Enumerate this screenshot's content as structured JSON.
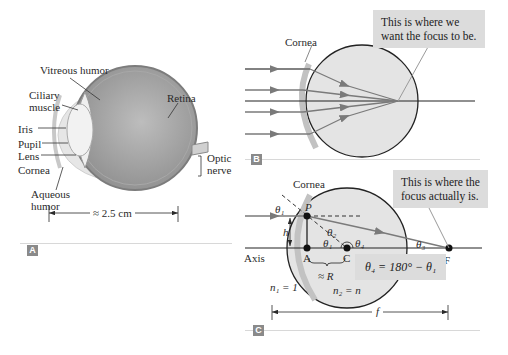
{
  "panels": {
    "A": {
      "badge": "A",
      "labels": {
        "vitreous": "Vitreous humor",
        "ciliary1": "Ciliary",
        "ciliary2": "muscle",
        "retina": "Retina",
        "iris": "Iris",
        "pupil": "Pupil",
        "lens": "Lens",
        "cornea": "Cornea",
        "aqueous1": "Aqueous",
        "aqueous2": "humor",
        "optic1": "Optic",
        "optic2": "nerve",
        "dimension": "≈ 2.5 cm"
      }
    },
    "B": {
      "badge": "B",
      "cornea_label": "Cornea",
      "callout": [
        "This is where we",
        "want the focus to be."
      ]
    },
    "C": {
      "badge": "C",
      "cornea_label": "Cornea",
      "callout": [
        "This is where the",
        "focus actually is."
      ],
      "points": {
        "P": "P",
        "A": "A",
        "C": "C",
        "F": "F"
      },
      "angles": {
        "theta1": "θ₁",
        "theta2": "θ₂",
        "theta3": "θ₃",
        "theta4": "θ₄",
        "theta1b": "θ₁"
      },
      "h": "h",
      "axis": "Axis",
      "radius": "≈ R",
      "n1": "n₁ = 1",
      "n2": "n₂ = n",
      "f": "f",
      "equation": "θ₄ = 180° − θ₁"
    }
  },
  "colors": {
    "ray": "#7a7a7a",
    "eye_fill": "#dedede",
    "cornea_fill": "#c8c8c8",
    "callout_bg": "#dcdcdc",
    "badge_bg": "#8a8a8a"
  }
}
